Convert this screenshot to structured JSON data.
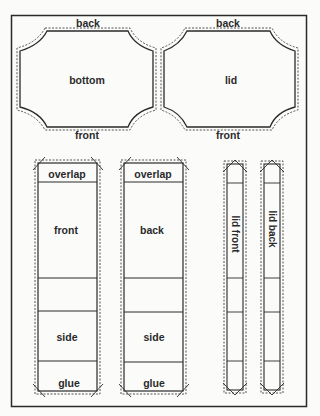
{
  "diagram": {
    "type": "box pattern template",
    "lid_panel": {
      "label": "lid",
      "top_label": "back",
      "bottom_label": "front"
    },
    "bottom_panel": {
      "label": "bottom",
      "top_label": "back",
      "bottom_label": "front"
    },
    "strips": [
      {
        "name": "front-strip",
        "sections": [
          "overlap",
          "front",
          "",
          "side",
          "glue"
        ]
      },
      {
        "name": "back-strip",
        "sections": [
          "overlap",
          "back",
          "",
          "side",
          "glue"
        ]
      },
      {
        "name": "lid-front-strip",
        "label": "lid front"
      },
      {
        "name": "lid-back-strip",
        "label": "lid back"
      }
    ],
    "colors": {
      "line": "#2a2a2a",
      "paper": "#fbfbfa"
    }
  }
}
